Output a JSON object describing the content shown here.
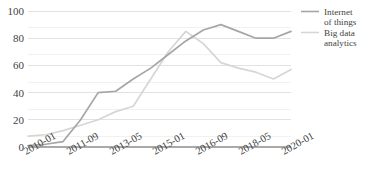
{
  "chart_data": {
    "type": "line",
    "title": "",
    "xlabel": "",
    "ylabel": "",
    "ylim": [
      0,
      100
    ],
    "yticks": [
      0,
      20,
      40,
      60,
      80,
      100
    ],
    "ytick_labels": [
      "0",
      "20",
      "40",
      "60",
      "80",
      "100"
    ],
    "grid": true,
    "grid_minor_step": 10,
    "legend_position": "right",
    "xtick_labels": [
      "2010-01",
      "2011-09",
      "2013-05",
      "2015-01",
      "2016-09",
      "2018-05",
      "2020-01"
    ],
    "x": [
      "2010-01",
      "2010-09",
      "2011-05",
      "2012-01",
      "2012-09",
      "2013-05",
      "2014-01",
      "2014-09",
      "2015-05",
      "2016-01",
      "2016-09",
      "2017-05",
      "2018-01",
      "2018-09",
      "2019-05",
      "2020-01"
    ],
    "series": [
      {
        "name": "Internet of things",
        "color": "#a6a6a6",
        "values": [
          1,
          2,
          4,
          20,
          40,
          41,
          50,
          58,
          68,
          78,
          86,
          90,
          85,
          80,
          80,
          85
        ]
      },
      {
        "name": "Big data analytics",
        "color": "#d6d6d6",
        "values": [
          8,
          9,
          12,
          16,
          20,
          26,
          30,
          50,
          70,
          85,
          76,
          62,
          58,
          55,
          50,
          57
        ]
      }
    ]
  },
  "legend": {
    "entries": [
      {
        "label_line1": "Internet",
        "label_line2": "of things"
      },
      {
        "label_line1": "Big data",
        "label_line2": "analytics"
      }
    ]
  }
}
